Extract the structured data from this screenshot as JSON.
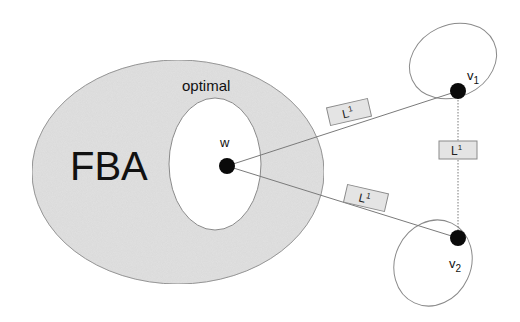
{
  "diagram": {
    "colors": {
      "fba_fill": "#e2e2e2",
      "outline": "#8a8a8a",
      "dot": "#0a0a0a",
      "label_box_fill": "#e4e4e4",
      "line": "#7a7a7a"
    },
    "regions": {
      "fba": {
        "label": "FBA"
      },
      "optimal": {
        "label": "optimal"
      }
    },
    "points": {
      "w": {
        "label": "w"
      },
      "v1": {
        "label": "v",
        "subscript": "1"
      },
      "v2": {
        "label": "v",
        "subscript": "2"
      }
    },
    "edges": [
      {
        "from": "w",
        "to": "v1",
        "style": "solid",
        "label": "L",
        "superscript": "1"
      },
      {
        "from": "w",
        "to": "v2",
        "style": "solid",
        "label": "L",
        "superscript": "1"
      },
      {
        "from": "v1",
        "to": "v2",
        "style": "dotted",
        "label": "L",
        "superscript": "1"
      }
    ]
  }
}
